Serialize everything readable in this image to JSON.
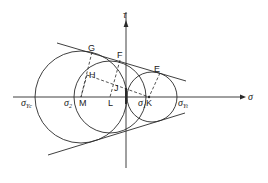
{
  "figure": {
    "axes": {
      "horizontal_label": "σ",
      "vertical_label": "τ"
    },
    "colors": {
      "stroke": "#2a2a2a",
      "background": "#ffffff"
    },
    "circles": [
      {
        "name": "large-circle",
        "center": "≈(-44, 0)",
        "label_left": "σ_Yc"
      },
      {
        "name": "middle-circle",
        "center": "L",
        "label_left": "σ2"
      },
      {
        "name": "small-circle",
        "center": "K",
        "label_right": "σ_Yt"
      }
    ],
    "points": {
      "E": "E",
      "F": "F",
      "G": "G",
      "H": "H",
      "J": "J",
      "K": "K",
      "L": "L",
      "M": "M"
    },
    "axis_labels": {
      "sigma_yc_main": "σ",
      "sigma_yc_sub": "Yc",
      "sigma_2_main": "σ",
      "sigma_2_sub": "2",
      "sigma_1_main": "σ",
      "sigma_1_sub": "1",
      "sigma_yt_main": "σ",
      "sigma_yt_sub": "Yt",
      "sigma_axis": "σ",
      "tau_axis": "τ"
    }
  }
}
